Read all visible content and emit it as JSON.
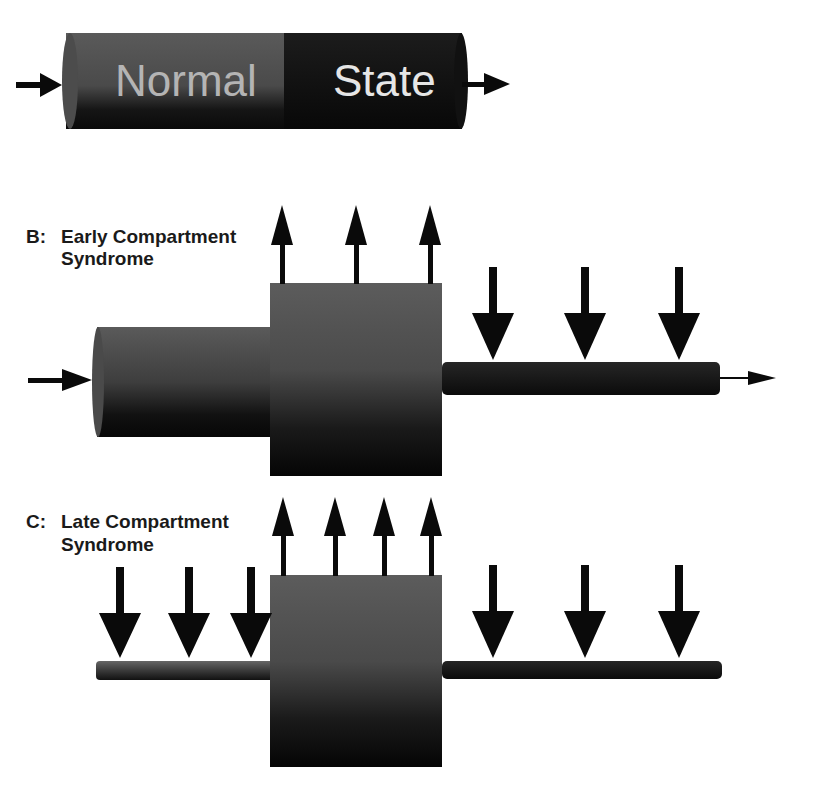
{
  "panel_a": {
    "label_left": "Normal",
    "label_right": "State",
    "colors": {
      "left_segment": "#555555",
      "right_segment": "#141414",
      "text_left": "#b8b8b8",
      "text_right": "#e6e6e6"
    }
  },
  "panel_b": {
    "letter": "B:",
    "title_line1": "Early Compartment",
    "title_line2": "Syndrome",
    "up_arrows": 3,
    "down_arrows": 3
  },
  "panel_c": {
    "letter": "C:",
    "title_line1": "Late Compartment",
    "title_line2": "Syndrome",
    "up_arrows": 4,
    "down_arrows_left": 3,
    "down_arrows_right": 3
  },
  "colors": {
    "arrow": "#0a0a0a",
    "box_top": "#5a5a5a",
    "box_bottom": "#050505",
    "background": "#ffffff"
  }
}
